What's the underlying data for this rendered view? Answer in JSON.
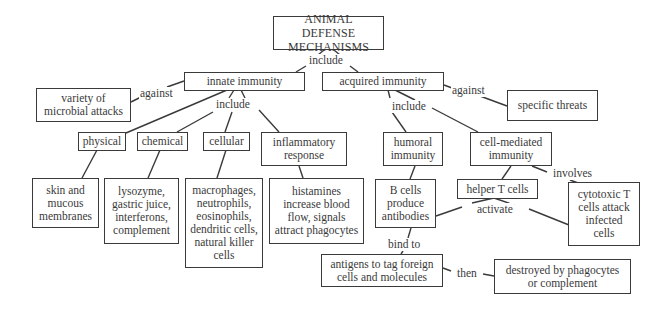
{
  "diagram": {
    "title": "ANIMAL DEFENSE\nMECHANISMS",
    "nodes": {
      "root": "ANIMAL DEFENSE\nMECHANISMS",
      "innate": "innate immunity",
      "acquired": "acquired immunity",
      "variety": "variety of\nmicrobial attacks",
      "specific": "specific threats",
      "physical": "physical",
      "chemical": "chemical",
      "cellular": "cellular",
      "inflammatory": "inflammatory\nresponse",
      "humoral": "humoral\nimmunity",
      "cell_mediated": "cell-mediated\nimmunity",
      "skin": "skin and\nmucous\nmembranes",
      "lysozyme": "lysozyme,\ngastric juice,\ninterferons,\ncomplement",
      "macrophages": "macrophages,\nneutrophils,\neosinophils,\ndendritic cells,\nnatural killer\ncells",
      "histamines": "histamines\nincrease blood\nflow, signals\nattract phagocytes",
      "b_cells": "B cells\nproduce\nantibodies",
      "helper_t": "helper T cells",
      "cytotoxic_t": "cytotoxic T\ncells attack\ninfected\ncells",
      "antigens": "antigens to tag foreign\ncells and molecules",
      "destroyed": "destroyed by phagocytes\nor complement"
    },
    "link_labels": {
      "root_include": "include",
      "innate_against": "against",
      "innate_include": "include",
      "acquired_against": "against",
      "acquired_include": "include",
      "cell_mediated_involves": "involves",
      "helper_activate": "activate",
      "b_cells_bind_to": "bind to",
      "antigens_then": "then"
    }
  }
}
